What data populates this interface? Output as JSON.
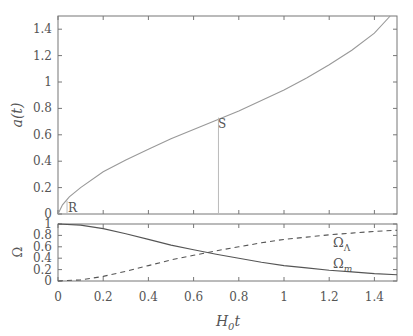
{
  "chart_data": [
    {
      "type": "line",
      "title": "",
      "xlabel": "",
      "ylabel": "a(t)",
      "xlim": [
        0,
        1.5
      ],
      "ylim": [
        0,
        1.5
      ],
      "xticks": [
        0,
        0.2,
        0.4,
        0.6,
        0.8,
        1,
        1.2,
        1.4
      ],
      "yticks": [
        "0",
        "0.2",
        "0.4",
        "0.6",
        "0.8",
        "1",
        "1.2",
        "1.4"
      ],
      "grid": false,
      "series": [
        {
          "name": "a(t)",
          "style": "solid",
          "color": "#999999",
          "x": [
            0,
            0.02,
            0.05,
            0.1,
            0.2,
            0.3,
            0.4,
            0.5,
            0.6,
            0.7,
            0.8,
            0.9,
            1.0,
            1.1,
            1.2,
            1.3,
            1.4,
            1.47
          ],
          "y": [
            0,
            0.07,
            0.13,
            0.2,
            0.32,
            0.41,
            0.49,
            0.57,
            0.64,
            0.71,
            0.78,
            0.86,
            0.94,
            1.03,
            1.13,
            1.24,
            1.37,
            1.5
          ]
        }
      ],
      "annotations": [
        {
          "label": "R",
          "x": 0.04,
          "y": 0.1,
          "marker_line_x": 0.04
        },
        {
          "label": "S",
          "x": 0.71,
          "y": 0.73,
          "marker_line_x": 0.71
        }
      ]
    },
    {
      "type": "line",
      "title": "",
      "xlabel": "H0t",
      "ylabel": "Ω",
      "xlim": [
        0,
        1.5
      ],
      "ylim": [
        0,
        1
      ],
      "xticks": [
        "0",
        "0.2",
        "0.4",
        "0.6",
        "0.8",
        "1",
        "1.2",
        "1.4"
      ],
      "yticks": [
        "0",
        "0.2",
        "0.4",
        "0.6",
        "0.8",
        "1"
      ],
      "grid": false,
      "series": [
        {
          "name": "Ω_m",
          "style": "solid",
          "color": "#555555",
          "x": [
            0,
            0.1,
            0.2,
            0.3,
            0.4,
            0.5,
            0.6,
            0.7,
            0.8,
            0.9,
            1.0,
            1.1,
            1.2,
            1.3,
            1.4,
            1.5
          ],
          "y": [
            1.0,
            0.98,
            0.92,
            0.83,
            0.73,
            0.63,
            0.55,
            0.47,
            0.4,
            0.33,
            0.27,
            0.23,
            0.19,
            0.16,
            0.13,
            0.11
          ]
        },
        {
          "name": "Ω_Λ",
          "style": "dashed",
          "color": "#555555",
          "x": [
            0,
            0.1,
            0.2,
            0.3,
            0.4,
            0.5,
            0.6,
            0.7,
            0.8,
            0.9,
            1.0,
            1.1,
            1.2,
            1.3,
            1.4,
            1.5
          ],
          "y": [
            0,
            0.02,
            0.08,
            0.17,
            0.27,
            0.37,
            0.45,
            0.53,
            0.6,
            0.67,
            0.73,
            0.77,
            0.81,
            0.84,
            0.87,
            0.89
          ]
        }
      ],
      "labels": [
        {
          "text": "Ω",
          "sub": "Λ",
          "x": 1.22,
          "y": 0.62
        },
        {
          "text": "Ω",
          "sub": "m",
          "x": 1.22,
          "y": 0.2
        }
      ]
    }
  ],
  "labels": {
    "upper_ylabel": "a(t)",
    "lower_ylabel": "Ω",
    "xlabel_main": "H",
    "xlabel_sub": "0",
    "xlabel_tail": "t",
    "omega_lambda": "Ω",
    "omega_lambda_sub": "Λ",
    "omega_m": "Ω",
    "omega_m_sub": "m",
    "marker_R": "R",
    "marker_S": "S"
  }
}
